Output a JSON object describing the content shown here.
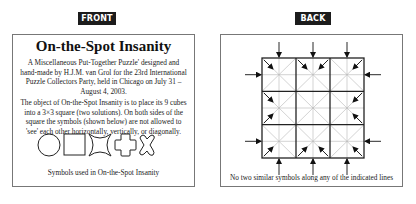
{
  "front": {
    "badge": "FRONT",
    "title": "On-the-Spot Insanity",
    "intro": "A Miscellaneous Put-Together Puzzle' designed and hand-made by H.J.M. van Grol for the 23rd International Puzzle Collectors Party, held in Chicago on July 31 – August 4, 2003.",
    "object": "The object of On-the-Spot Insanity is to place its 9 cubes into a 3×3 square (two solutions). On both sides of the square the symbols (shown below) are not allowed to 'see' each other horizontally, vertically, or diagonally.",
    "symbols": [
      "circle-icon",
      "square-icon",
      "four-point-star-icon",
      "rounded-cross-icon",
      "rounded-x-icon"
    ],
    "caption": "Symbols used in On-the-Spot Insanity"
  },
  "back": {
    "badge": "BACK",
    "grid": {
      "rows": 3,
      "cols": 3,
      "subdivisions": 2
    },
    "caption": "No two similar symbols along any of the indicated lines"
  },
  "colors": {
    "badge_bg": "#1c1c1c",
    "badge_text": "#ffffff",
    "border": "#777777",
    "grid_line": "#222222",
    "sub_line": "#b0b0b0"
  }
}
